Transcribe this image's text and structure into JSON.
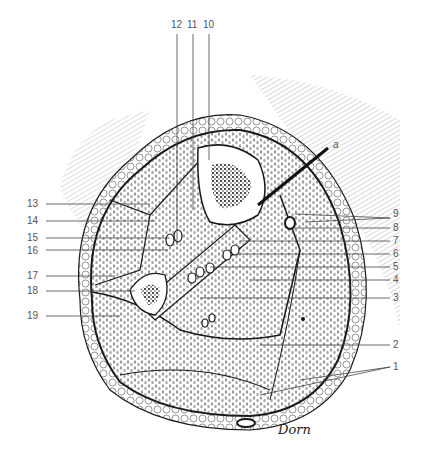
{
  "figure": {
    "pointer_label": "a",
    "signature": "Dorn",
    "labels": [
      {
        "id": "1",
        "x": 393,
        "y": 362
      },
      {
        "id": "2",
        "x": 393,
        "y": 342
      },
      {
        "id": "3",
        "x": 393,
        "y": 298
      },
      {
        "id": "4",
        "x": 393,
        "y": 280
      },
      {
        "id": "5",
        "x": 393,
        "y": 267
      },
      {
        "id": "6",
        "x": 393,
        "y": 254
      },
      {
        "id": "7",
        "x": 393,
        "y": 241
      },
      {
        "id": "8",
        "x": 393,
        "y": 228
      },
      {
        "id": "9",
        "x": 393,
        "y": 213
      },
      {
        "id": "10",
        "x": 205,
        "y": 22
      },
      {
        "id": "11",
        "x": 188,
        "y": 22
      },
      {
        "id": "12",
        "x": 172,
        "y": 22
      },
      {
        "id": "13",
        "x": 28,
        "y": 204
      },
      {
        "id": "14",
        "x": 28,
        "y": 221
      },
      {
        "id": "15",
        "x": 28,
        "y": 238
      },
      {
        "id": "16",
        "x": 28,
        "y": 250
      },
      {
        "id": "17",
        "x": 28,
        "y": 276
      },
      {
        "id": "18",
        "x": 28,
        "y": 291
      },
      {
        "id": "19",
        "x": 28,
        "y": 316
      }
    ],
    "colors": {
      "ink": "#1a1a1a",
      "label": "#555555",
      "leader": "#444444",
      "paper": "#ffffff"
    }
  }
}
